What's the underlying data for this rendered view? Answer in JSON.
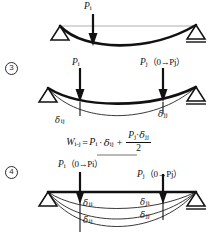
{
  "figure": {
    "ink_color": "#111111",
    "thin_color": "#4a4a4a",
    "panels": [
      {
        "id": "panel-2",
        "number": "",
        "loads": [
          {
            "name": "load-pi",
            "symbol": "P",
            "subscript": "i",
            "range": ""
          }
        ],
        "deflection_labels": []
      },
      {
        "id": "panel-3",
        "number": "3",
        "loads": [
          {
            "name": "load-pi",
            "symbol": "P",
            "subscript": "i",
            "range": ""
          },
          {
            "name": "load-pj",
            "symbol": "P",
            "subscript": "j",
            "range": "（0→Pj）"
          }
        ],
        "deflection_labels": [
          {
            "name": "delta-ij",
            "glyph": "δ",
            "subscript": "ij"
          },
          {
            "name": "delta-jj",
            "glyph": "δ",
            "subscript": "jj"
          }
        ]
      },
      {
        "id": "panel-4",
        "number": "4",
        "loads": [
          {
            "name": "load-pi",
            "symbol": "P",
            "subscript": "i",
            "range": "（0→Pi）"
          },
          {
            "name": "load-pj",
            "symbol": "P",
            "subscript": "j",
            "range": "（0→Pj）"
          }
        ],
        "deflection_labels": [
          {
            "name": "delta-ii",
            "glyph": "δ",
            "subscript": "ii"
          },
          {
            "name": "delta-ij",
            "glyph": "δ",
            "subscript": "ij"
          },
          {
            "name": "delta-ji",
            "glyph": "δ",
            "subscript": "ji"
          },
          {
            "name": "delta-jj",
            "glyph": "δ",
            "subscript": "jj"
          }
        ]
      }
    ],
    "formula": {
      "lhs_symbol": "W",
      "lhs_subscript": "i-j",
      "equals": "=",
      "term1_symbol": "P",
      "term1_subscript": "i",
      "dot": "·",
      "term1_delta": "δ",
      "term1_delta_subscript": "ij",
      "plus": "+",
      "numerator_symbol": "P",
      "numerator_subscript": "j",
      "numerator_dot": "·",
      "numerator_delta": "δ",
      "numerator_delta_subscript": "jj",
      "denominator": "2"
    },
    "labels": {
      "pi_left_x_panel2": "Pi applied at point i",
      "support_left": "pin-support",
      "support_right": "roller-support"
    }
  }
}
